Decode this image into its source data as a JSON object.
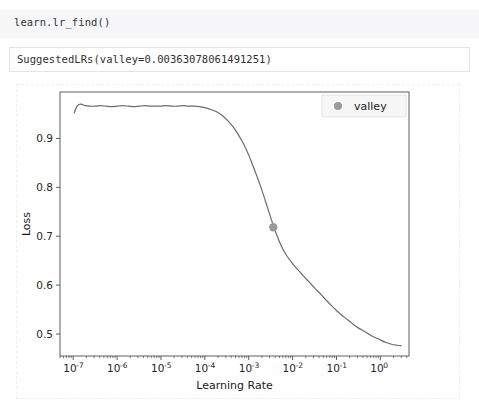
{
  "notebook": {
    "code_cell": {
      "source": "learn.lr_find()"
    },
    "output_cell": {
      "text": "SuggestedLRs(valley=0.00363078061491251)"
    }
  },
  "colors": {
    "curve": "#6b6b6b",
    "marker": "#9a9a9a",
    "axis": "#4d4d4d",
    "code_bg": "#f7f7f9",
    "output_border": "#e4e4e8",
    "figure_border": "#eceef1"
  },
  "chart_data": {
    "type": "line",
    "title": "",
    "xlabel": "Learning Rate",
    "ylabel": "Loss",
    "xscale": "log",
    "yscale": "linear",
    "xlim": [
      5e-08,
      4.5
    ],
    "ylim": [
      0.455,
      0.995
    ],
    "grid": false,
    "legend": {
      "position": "upper right",
      "entries": [
        {
          "label": "valley",
          "marker": "circle",
          "color": "#9a9a9a"
        }
      ]
    },
    "x_ticks": [
      {
        "value": 1e-07,
        "label": "10",
        "exponent": "-7"
      },
      {
        "value": 1e-06,
        "label": "10",
        "exponent": "-6"
      },
      {
        "value": 1e-05,
        "label": "10",
        "exponent": "-5"
      },
      {
        "value": 0.0001,
        "label": "10",
        "exponent": "-4"
      },
      {
        "value": 0.001,
        "label": "10",
        "exponent": "-3"
      },
      {
        "value": 0.01,
        "label": "10",
        "exponent": "-2"
      },
      {
        "value": 0.1,
        "label": "10",
        "exponent": "-1"
      },
      {
        "value": 1,
        "label": "10",
        "exponent": "0"
      }
    ],
    "y_ticks": [
      {
        "value": 0.9,
        "label": "0.9"
      },
      {
        "value": 0.8,
        "label": "0.8"
      },
      {
        "value": 0.7,
        "label": "0.7"
      },
      {
        "value": 0.6,
        "label": "0.6"
      },
      {
        "value": 0.5,
        "label": "0.5"
      }
    ],
    "annotations": [
      {
        "name": "valley",
        "x": 0.00363078061491251,
        "y": 0.7185,
        "marker": "circle",
        "color": "#9a9a9a"
      }
    ],
    "series": [
      {
        "name": "loss",
        "color": "#6b6b6b",
        "x": [
          1.05e-07,
          1.25e-07,
          1.5e-07,
          1.9e-07,
          2.4e-07,
          3.2e-07,
          4.2e-07,
          5.6e-07,
          7.5e-07,
          1e-06,
          1.3e-06,
          1.8e-06,
          2.4e-06,
          3.2e-06,
          4.2e-06,
          5.6e-06,
          7.5e-06,
          1e-05,
          1.3e-05,
          1.8e-05,
          2.4e-05,
          3.2e-05,
          4.2e-05,
          5.6e-05,
          7.5e-05,
          0.0001,
          0.00013,
          0.00018,
          0.00024,
          0.00032,
          0.00042,
          0.00056,
          0.00075,
          0.001,
          0.0013,
          0.0018,
          0.0024,
          0.0032,
          0.0042,
          0.0056,
          0.0075,
          0.01,
          0.013,
          0.018,
          0.024,
          0.032,
          0.042,
          0.056,
          0.075,
          0.1,
          0.13,
          0.18,
          0.24,
          0.32,
          0.42,
          0.56,
          0.75,
          1.0,
          1.3,
          1.8,
          2.4,
          3.0
        ],
        "y": [
          0.952,
          0.967,
          0.97,
          0.967,
          0.966,
          0.966,
          0.967,
          0.966,
          0.965,
          0.966,
          0.967,
          0.966,
          0.965,
          0.966,
          0.967,
          0.966,
          0.966,
          0.966,
          0.967,
          0.966,
          0.966,
          0.967,
          0.966,
          0.966,
          0.965,
          0.963,
          0.96,
          0.955,
          0.948,
          0.938,
          0.926,
          0.91,
          0.89,
          0.866,
          0.84,
          0.806,
          0.772,
          0.737,
          0.706,
          0.679,
          0.659,
          0.644,
          0.632,
          0.618,
          0.606,
          0.594,
          0.583,
          0.571,
          0.559,
          0.548,
          0.539,
          0.529,
          0.52,
          0.512,
          0.506,
          0.499,
          0.493,
          0.488,
          0.483,
          0.479,
          0.477,
          0.476
        ]
      }
    ]
  }
}
